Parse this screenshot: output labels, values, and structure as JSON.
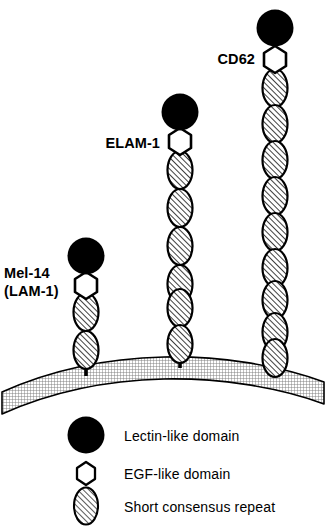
{
  "figure": {
    "type": "selectin-family-domain-diagram",
    "molecules": [
      {
        "id": "mel14",
        "label_line1": "Mel-14",
        "label_line2": "(LAM-1)",
        "stalk_x": 86,
        "anchor_y": 370,
        "scr_count": 2,
        "lectin_domain": "Lectin-like domain",
        "egf_domain": "EGF-like domain"
      },
      {
        "id": "elam1",
        "label_line1": "ELAM-1",
        "label_line2": "",
        "stalk_x": 180,
        "anchor_y": 364,
        "scr_count": 6,
        "lectin_domain": "Lectin-like domain",
        "egf_domain": "EGF-like domain"
      },
      {
        "id": "cd62",
        "label_line1": "CD62",
        "label_line2": "",
        "stalk_x": 275,
        "anchor_y": 370,
        "scr_count": 9,
        "lectin_domain": "Lectin-like domain",
        "egf_domain": "EGF-like domain"
      }
    ],
    "membrane": {
      "name": "cell membrane"
    }
  },
  "legend": {
    "items": [
      {
        "icon": "filled-circle",
        "label": "Lectin-like domain"
      },
      {
        "icon": "open-hexagon",
        "label": "EGF-like domain"
      },
      {
        "icon": "hatched-ellipse",
        "label": "Short consensus repeat"
      }
    ]
  },
  "colors": {
    "ink": "#000000",
    "paper": "#ffffff",
    "membrane_fill": "#c8c8c8",
    "scr_fill": "#ffffff",
    "hatch": "#000000"
  }
}
